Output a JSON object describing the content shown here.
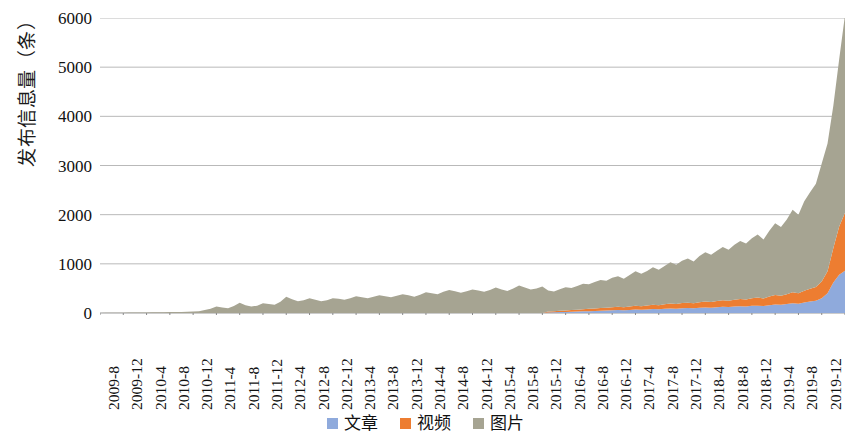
{
  "chart_data": {
    "type": "area",
    "stacked": true,
    "title": "",
    "subtitle": "",
    "xlabel": "",
    "ylabel": "发布信息量（条）",
    "ylim": [
      0,
      6000
    ],
    "y_ticks": [
      0,
      1000,
      2000,
      3000,
      4000,
      5000,
      6000
    ],
    "grid": true,
    "legend_position": "bottom",
    "legend": [
      "文章",
      "视频",
      "图片"
    ],
    "colors": {
      "文章": "#8faadc",
      "视频": "#ed7d31",
      "图片": "#a6a492"
    },
    "x_tick_labels": [
      "2009-8",
      "2009-12",
      "2010-4",
      "2010-8",
      "2010-12",
      "2011-4",
      "2011-8",
      "2011-12",
      "2012-4",
      "2012-8",
      "2012-12",
      "2013-4",
      "2013-8",
      "2013-12",
      "2014-4",
      "2014-8",
      "2014-12",
      "2015-4",
      "2015-8",
      "2015-12",
      "2016-4",
      "2016-8",
      "2016-12",
      "2017-4",
      "2017-8",
      "2017-12",
      "2018-4",
      "2018-8",
      "2018-12",
      "2019-4",
      "2019-8",
      "2019-12",
      "2020-4"
    ],
    "x": [
      "2009-8",
      "2009-9",
      "2009-10",
      "2009-11",
      "2009-12",
      "2010-1",
      "2010-2",
      "2010-3",
      "2010-4",
      "2010-5",
      "2010-6",
      "2010-7",
      "2010-8",
      "2010-9",
      "2010-10",
      "2010-11",
      "2010-12",
      "2011-1",
      "2011-2",
      "2011-3",
      "2011-4",
      "2011-5",
      "2011-6",
      "2011-7",
      "2011-8",
      "2011-9",
      "2011-10",
      "2011-11",
      "2011-12",
      "2012-1",
      "2012-2",
      "2012-3",
      "2012-4",
      "2012-5",
      "2012-6",
      "2012-7",
      "2012-8",
      "2012-9",
      "2012-10",
      "2012-11",
      "2012-12",
      "2013-1",
      "2013-2",
      "2013-3",
      "2013-4",
      "2013-5",
      "2013-6",
      "2013-7",
      "2013-8",
      "2013-9",
      "2013-10",
      "2013-11",
      "2013-12",
      "2014-1",
      "2014-2",
      "2014-3",
      "2014-4",
      "2014-5",
      "2014-6",
      "2014-7",
      "2014-8",
      "2014-9",
      "2014-10",
      "2014-11",
      "2014-12",
      "2015-1",
      "2015-2",
      "2015-3",
      "2015-4",
      "2015-5",
      "2015-6",
      "2015-7",
      "2015-8",
      "2015-9",
      "2015-10",
      "2015-11",
      "2015-12",
      "2016-1",
      "2016-2",
      "2016-3",
      "2016-4",
      "2016-5",
      "2016-6",
      "2016-7",
      "2016-8",
      "2016-9",
      "2016-10",
      "2016-11",
      "2016-12",
      "2017-1",
      "2017-2",
      "2017-3",
      "2017-4",
      "2017-5",
      "2017-6",
      "2017-7",
      "2017-8",
      "2017-9",
      "2017-10",
      "2017-11",
      "2017-12",
      "2018-1",
      "2018-2",
      "2018-3",
      "2018-4",
      "2018-5",
      "2018-6",
      "2018-7",
      "2018-8",
      "2018-9",
      "2018-10",
      "2018-11",
      "2018-12",
      "2019-1",
      "2019-2",
      "2019-3",
      "2019-4",
      "2019-5",
      "2019-6",
      "2019-7",
      "2019-8",
      "2019-9",
      "2019-10",
      "2019-11",
      "2019-12",
      "2020-1",
      "2020-2",
      "2020-3",
      "2020-4"
    ],
    "series": [
      {
        "name": "文章",
        "color": "#8faadc",
        "values": [
          0,
          0,
          0,
          0,
          0,
          0,
          0,
          0,
          0,
          0,
          0,
          0,
          0,
          0,
          0,
          0,
          0,
          0,
          0,
          0,
          0,
          0,
          0,
          0,
          0,
          0,
          0,
          0,
          0,
          0,
          0,
          0,
          0,
          0,
          0,
          0,
          0,
          0,
          0,
          0,
          0,
          0,
          0,
          0,
          0,
          0,
          0,
          0,
          0,
          0,
          0,
          0,
          0,
          0,
          0,
          0,
          0,
          0,
          0,
          0,
          0,
          0,
          0,
          0,
          0,
          0,
          0,
          0,
          0,
          0,
          0,
          0,
          0,
          0,
          0,
          0,
          0,
          10,
          14,
          18,
          22,
          26,
          30,
          34,
          38,
          42,
          46,
          50,
          55,
          60,
          58,
          62,
          70,
          66,
          72,
          80,
          76,
          85,
          92,
          88,
          96,
          100,
          95,
          105,
          112,
          108,
          118,
          125,
          120,
          130,
          138,
          132,
          145,
          150,
          140,
          160,
          175,
          168,
          182,
          200,
          190,
          215,
          235,
          250,
          300,
          400,
          620,
          780,
          860
        ]
      },
      {
        "name": "视频",
        "color": "#ed7d31",
        "values": [
          0,
          0,
          0,
          0,
          0,
          0,
          0,
          0,
          0,
          0,
          0,
          0,
          0,
          0,
          0,
          0,
          0,
          0,
          0,
          0,
          0,
          0,
          0,
          0,
          0,
          0,
          0,
          0,
          0,
          0,
          0,
          0,
          0,
          0,
          0,
          0,
          0,
          0,
          0,
          0,
          0,
          0,
          0,
          0,
          0,
          0,
          0,
          0,
          0,
          0,
          0,
          0,
          0,
          0,
          0,
          0,
          0,
          0,
          0,
          0,
          0,
          0,
          0,
          0,
          0,
          0,
          0,
          0,
          0,
          0,
          0,
          0,
          0,
          0,
          0,
          0,
          0,
          18,
          22,
          26,
          30,
          34,
          38,
          42,
          46,
          50,
          54,
          58,
          62,
          66,
          60,
          70,
          78,
          72,
          80,
          88,
          82,
          92,
          100,
          95,
          105,
          110,
          102,
          115,
          122,
          116,
          128,
          135,
          128,
          140,
          148,
          142,
          155,
          165,
          155,
          175,
          190,
          182,
          200,
          220,
          210,
          240,
          260,
          280,
          340,
          450,
          700,
          980,
          1180
        ]
      },
      {
        "name": "图片",
        "color": "#a6a492",
        "values": [
          2,
          3,
          4,
          5,
          6,
          8,
          10,
          9,
          12,
          14,
          13,
          16,
          18,
          20,
          22,
          24,
          28,
          35,
          60,
          85,
          130,
          110,
          95,
          140,
          210,
          160,
          130,
          150,
          200,
          185,
          170,
          230,
          330,
          280,
          240,
          260,
          300,
          270,
          240,
          260,
          300,
          290,
          270,
          300,
          340,
          320,
          300,
          330,
          360,
          340,
          320,
          350,
          380,
          360,
          330,
          370,
          420,
          400,
          380,
          430,
          470,
          440,
          410,
          440,
          480,
          460,
          430,
          470,
          520,
          480,
          450,
          500,
          560,
          520,
          480,
          500,
          540,
          430,
          400,
          440,
          470,
          450,
          480,
          520,
          500,
          540,
          570,
          550,
          600,
          620,
          580,
          640,
          700,
          660,
          700,
          760,
          720,
          780,
          840,
          800,
          860,
          900,
          850,
          940,
          1000,
          960,
          1020,
          1080,
          1040,
          1120,
          1180,
          1140,
          1220,
          1280,
          1200,
          1340,
          1460,
          1400,
          1520,
          1680,
          1600,
          1820,
          1960,
          2100,
          2400,
          2600,
          2900,
          3400,
          4020
        ]
      }
    ],
    "totals_note": "stacked totals peak at approximately 5200 at 2020-4"
  },
  "legend_items": [
    {
      "label": "文章",
      "color": "#8faadc",
      "swatch": "square-swatch"
    },
    {
      "label": "视频",
      "color": "#ed7d31",
      "swatch": "square-swatch"
    },
    {
      "label": "图片",
      "color": "#a6a492",
      "swatch": "square-swatch"
    }
  ]
}
